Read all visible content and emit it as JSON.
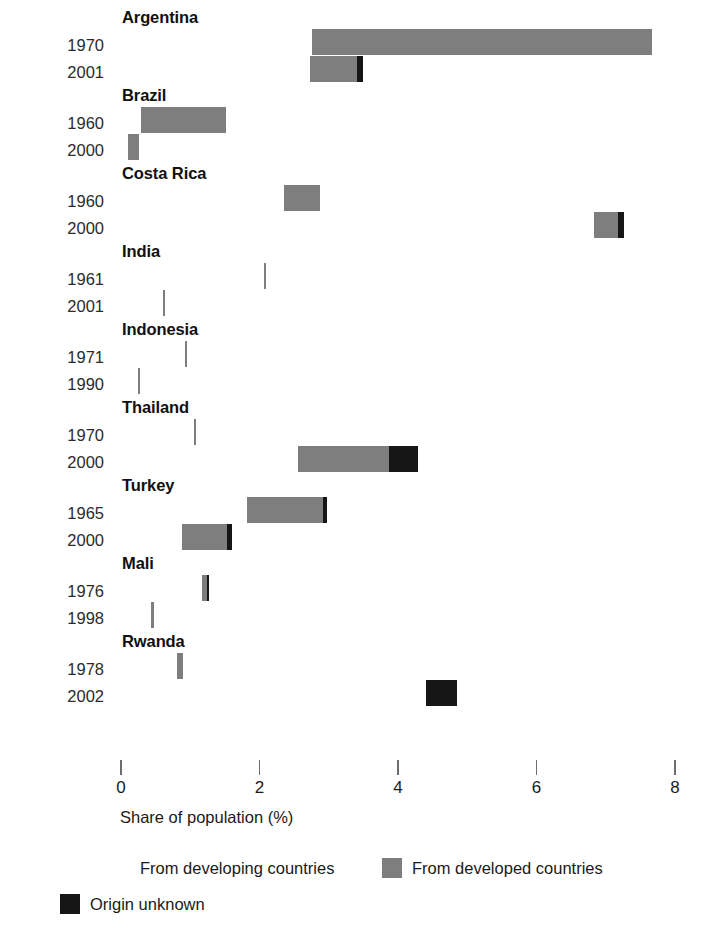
{
  "chart_data": {
    "type": "bar",
    "orientation": "horizontal",
    "title": "",
    "xlabel": "Share of population (%)",
    "ylabel": "",
    "xlim": [
      0,
      8
    ],
    "xticks": [
      0,
      2,
      4,
      6,
      8
    ],
    "xtick_labels": [
      "0",
      "2",
      "4",
      "6",
      "8"
    ],
    "grid": false,
    "stacked": true,
    "legend_position": "bottom",
    "colors": {
      "developing": "#ffffff",
      "developed": "#7e7e7e",
      "unknown": "#161616"
    },
    "series": [
      {
        "name": "From developing countries",
        "key": "developing"
      },
      {
        "name": "From developed countries",
        "key": "developed"
      },
      {
        "name": "Origin unknown",
        "key": "unknown"
      }
    ],
    "groups": [
      {
        "country": "Argentina",
        "rows": [
          {
            "year": "1970",
            "start": 2.76,
            "developing": 0.0,
            "developed": 4.91,
            "unknown": 0.0,
            "total_end": 7.67
          },
          {
            "year": "2001",
            "start": 2.73,
            "developing": 0.0,
            "developed": 0.68,
            "unknown": 0.09,
            "total_end": 3.5
          }
        ]
      },
      {
        "country": "Brazil",
        "rows": [
          {
            "year": "1960",
            "start": 0.29,
            "developing": 0.0,
            "developed": 1.23,
            "unknown": 0.0,
            "total_end": 1.52
          },
          {
            "year": "2000",
            "start": 0.1,
            "developing": 0.0,
            "developed": 0.16,
            "unknown": 0.0,
            "total_end": 0.26
          }
        ]
      },
      {
        "country": "Costa Rica",
        "rows": [
          {
            "year": "1960",
            "start": 2.35,
            "developing": 0.0,
            "developed": 0.52,
            "unknown": 0.0,
            "total_end": 2.87
          },
          {
            "year": "2000",
            "start": 6.83,
            "developing": 0.0,
            "developed": 0.35,
            "unknown": 0.09,
            "total_end": 7.27
          }
        ]
      },
      {
        "country": "India",
        "rows": [
          {
            "year": "1961",
            "start": 2.07,
            "developing": 0.0,
            "developed": 0.03,
            "unknown": 0.0,
            "total_end": 2.1
          },
          {
            "year": "2001",
            "start": 0.6,
            "developing": 0.0,
            "developed": 0.03,
            "unknown": 0.0,
            "total_end": 0.63
          }
        ]
      },
      {
        "country": "Indonesia",
        "rows": [
          {
            "year": "1971",
            "start": 0.93,
            "developing": 0.0,
            "developed": 0.03,
            "unknown": 0.0,
            "total_end": 0.96
          },
          {
            "year": "1990",
            "start": 0.24,
            "developing": 0.0,
            "developed": 0.03,
            "unknown": 0.0,
            "total_end": 0.27
          }
        ]
      },
      {
        "country": "Thailand",
        "rows": [
          {
            "year": "1970",
            "start": 1.06,
            "developing": 0.0,
            "developed": 0.03,
            "unknown": 0.0,
            "total_end": 1.09
          },
          {
            "year": "2000",
            "start": 2.56,
            "developing": 0.0,
            "developed": 1.31,
            "unknown": 0.42,
            "total_end": 4.29
          }
        ]
      },
      {
        "country": "Turkey",
        "rows": [
          {
            "year": "1965",
            "start": 1.82,
            "developing": 0.0,
            "developed": 1.1,
            "unknown": 0.06,
            "total_end": 2.98
          },
          {
            "year": "2000",
            "start": 0.88,
            "developing": 0.0,
            "developed": 0.65,
            "unknown": 0.07,
            "total_end": 1.6
          }
        ]
      },
      {
        "country": "Mali",
        "rows": [
          {
            "year": "1976",
            "start": 1.17,
            "developing": 0.0,
            "developed": 0.07,
            "unknown": 0.03,
            "total_end": 1.27
          },
          {
            "year": "1998",
            "start": 0.44,
            "developing": 0.0,
            "developed": 0.03,
            "unknown": 0.0,
            "total_end": 0.47
          }
        ]
      },
      {
        "country": "Rwanda",
        "rows": [
          {
            "year": "1978",
            "start": 0.81,
            "developing": 0.0,
            "developed": 0.09,
            "unknown": 0.0,
            "total_end": 0.9
          },
          {
            "year": "2002",
            "start": 4.4,
            "developing": 0.0,
            "developed": 0.0,
            "unknown": 0.45,
            "total_end": 4.85
          }
        ]
      }
    ]
  },
  "axis": {
    "title": "Share of population (%)",
    "ticks": [
      "0",
      "2",
      "4",
      "6",
      "8"
    ]
  },
  "legend": {
    "items": [
      {
        "label": "From developing countries",
        "swatch": "developing"
      },
      {
        "label": "From developed countries",
        "swatch": "developed"
      },
      {
        "label": "Origin unknown",
        "swatch": "unknown"
      }
    ]
  }
}
